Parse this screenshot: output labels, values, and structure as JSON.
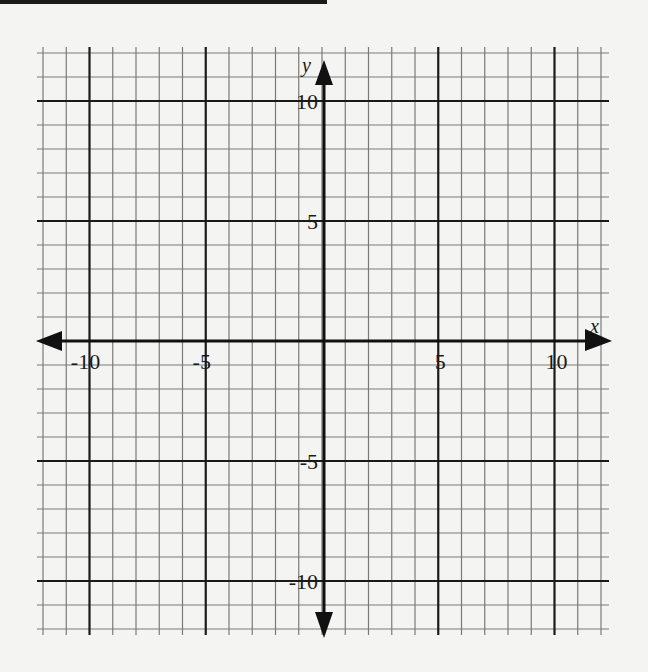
{
  "chart_data": {
    "type": "scatter",
    "title": "",
    "xlabel": "x",
    "ylabel": "y",
    "xlim": [
      -12,
      12
    ],
    "ylim": [
      -12,
      12
    ],
    "grid": true,
    "grid_step": 1,
    "major_grid_step": 5,
    "x_tick_labels": [
      "-10",
      "-5",
      "5",
      "10"
    ],
    "x_tick_values": [
      -10,
      -5,
      5,
      10
    ],
    "y_tick_labels": [
      "10",
      "5",
      "-5",
      "-10"
    ],
    "y_tick_values": [
      10,
      5,
      -5,
      -10
    ],
    "series": [],
    "axes_arrows": true
  },
  "axis": {
    "x_label": "x",
    "y_label": "y"
  },
  "colors": {
    "background": "#f4f4f2",
    "minor_grid": "#7a7a7a",
    "major_grid": "#1a1a1a",
    "axis": "#111111"
  }
}
